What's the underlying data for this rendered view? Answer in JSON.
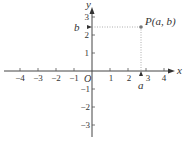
{
  "diagram": {
    "axes": {
      "x_label": "x",
      "y_label": "y",
      "origin_label": "O",
      "x_ticks": [
        "−4",
        "−3",
        "−2",
        "−1",
        "1",
        "2",
        "3",
        "4"
      ],
      "y_ticks_pos": [
        "1",
        "2",
        "3"
      ],
      "y_ticks_neg": [
        "−1",
        "−2",
        "−3"
      ]
    },
    "point": {
      "label": "P(a, b)",
      "x_label": "a",
      "y_label": "b",
      "x": 2.7,
      "y": 2.4
    },
    "colors": {
      "axis": "#333333",
      "point": "#777777",
      "dotted": "#999999"
    }
  }
}
